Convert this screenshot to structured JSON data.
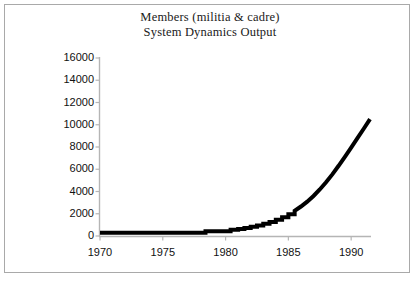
{
  "chart_data": {
    "type": "line",
    "title": "Members (militia & cadre)\nSystem Dynamics Output",
    "title_lines": [
      "Members (militia & cadre)",
      "System Dynamics Output"
    ],
    "xlabel": "",
    "ylabel": "",
    "grid": false,
    "legend": null,
    "xlim": [
      1970,
      1991.5
    ],
    "ylim": [
      0,
      16000
    ],
    "xticks": [
      1970,
      1975,
      1980,
      1985,
      1990
    ],
    "xtick_labels": [
      "1970",
      "1975",
      "1980",
      "1985",
      "1990"
    ],
    "yticks": [
      0,
      2000,
      4000,
      6000,
      8000,
      10000,
      12000,
      14000,
      16000
    ],
    "ytick_labels": [
      "0",
      "2000",
      "4000",
      "6000",
      "8000",
      "10000",
      "12000",
      "14000",
      "16000"
    ],
    "series": [
      {
        "name": "Members (militia & cadre)",
        "color": "#000000",
        "line_width": 4,
        "step_style": "staircase",
        "x": [
          1970.0,
          1971.0,
          1972.0,
          1973.0,
          1974.0,
          1975.0,
          1976.0,
          1977.0,
          1978.0,
          1978.4,
          1979.0,
          1980.0,
          1980.4,
          1981.0,
          1981.5,
          1982.0,
          1982.5,
          1983.0,
          1983.5,
          1984.0,
          1984.5,
          1985.0,
          1985.5,
          1986.0,
          1986.5,
          1987.0,
          1987.5,
          1988.0,
          1988.5,
          1989.0,
          1989.5,
          1990.0,
          1990.5,
          1991.0,
          1991.5
        ],
        "y": [
          300,
          300,
          300,
          300,
          300,
          300,
          300,
          300,
          300,
          430,
          430,
          430,
          560,
          640,
          720,
          830,
          950,
          1090,
          1260,
          1450,
          1680,
          1950,
          2270,
          2650,
          3090,
          3600,
          4180,
          4830,
          5540,
          6310,
          7120,
          7950,
          8790,
          9640,
          10500
        ]
      }
    ],
    "axis_color": "#b5b5b5",
    "background": "#ffffff"
  },
  "frame": {
    "border_color": "#a9a9a9"
  }
}
